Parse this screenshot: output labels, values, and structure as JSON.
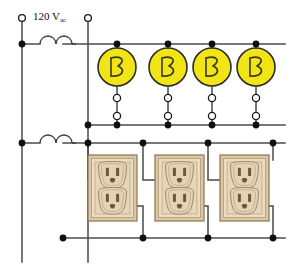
{
  "diagram": {
    "type": "schematic",
    "canvas": {
      "width": 297,
      "height": 272
    },
    "colors": {
      "wire": "#4a4a4a",
      "node": "#101010",
      "lamp_fill": "#f2e515",
      "lamp_stroke": "#2b2b2b",
      "filament": "#3a3a20",
      "outlet_plate": "#e8d9bf",
      "outlet_plate_edge": "#b29a74",
      "outlet_face": "#e0cfb2",
      "outlet_slot": "#6b5639",
      "terminal_open_stroke": "#1a1a1a",
      "terminal_open_fill": "#ffffff",
      "background": "#ffffff"
    },
    "source": {
      "label_voltage": "120 V",
      "label_subscript": "ac",
      "label_full": "120 Vac",
      "terminal_left_x": 22,
      "terminal_right_x": 88,
      "terminal_y": 18
    },
    "buses": [
      {
        "name": "upper-hot-bus",
        "y": 44,
        "x1": 22,
        "x2": 285
      },
      {
        "name": "upper-neutral-bus",
        "y": 125,
        "x1": 22,
        "x2": 285
      },
      {
        "name": "lower-hot-bus",
        "y": 143,
        "x1": 22,
        "x2": 285
      },
      {
        "name": "lower-neutral-bus",
        "y": 238,
        "x1": 22,
        "x2": 285
      }
    ],
    "rails": [
      {
        "name": "left-rail",
        "x": 22,
        "y1": 18,
        "y2": 262
      },
      {
        "name": "second-rail",
        "x": 88,
        "y1": 18,
        "y2": 262
      }
    ],
    "coils": [
      {
        "name": "upper-transformer-coil",
        "cx": 55,
        "cy": 44,
        "arcs": 2
      },
      {
        "name": "lower-transformer-coil",
        "cx": 55,
        "cy": 143,
        "arcs": 2
      }
    ],
    "lamps": [
      {
        "id": "lamp-1",
        "cx": 117,
        "cy": 67,
        "r": 19,
        "glyph": "filament"
      },
      {
        "id": "lamp-2",
        "cx": 168,
        "cy": 67,
        "r": 19,
        "glyph": "filament"
      },
      {
        "id": "lamp-3",
        "cx": 212,
        "cy": 67,
        "r": 19,
        "glyph": "filament"
      },
      {
        "id": "lamp-4",
        "cx": 256,
        "cy": 67,
        "r": 19,
        "glyph": "filament"
      }
    ],
    "lamp_terminals": [
      {
        "cx": 117,
        "cy": 98
      },
      {
        "cx": 117,
        "cy": 116
      },
      {
        "cx": 168,
        "cy": 98
      },
      {
        "cx": 168,
        "cy": 116
      },
      {
        "cx": 212,
        "cy": 98
      },
      {
        "cx": 212,
        "cy": 116
      },
      {
        "cx": 256,
        "cy": 98
      },
      {
        "cx": 256,
        "cy": 116
      }
    ],
    "receptacles": [
      {
        "id": "receptacle-1",
        "x": 88,
        "y": 155,
        "w": 49,
        "h": 66,
        "outlets": 2
      },
      {
        "id": "receptacle-2",
        "x": 155,
        "y": 155,
        "w": 49,
        "h": 66,
        "outlets": 2
      },
      {
        "id": "receptacle-3",
        "x": 220,
        "y": 155,
        "w": 49,
        "h": 66,
        "outlets": 2
      }
    ],
    "junction_nodes": [
      {
        "x": 22,
        "y": 44
      },
      {
        "x": 22,
        "y": 143
      },
      {
        "x": 117,
        "y": 44
      },
      {
        "x": 168,
        "y": 44
      },
      {
        "x": 212,
        "y": 44
      },
      {
        "x": 256,
        "y": 44
      },
      {
        "x": 88,
        "y": 125
      },
      {
        "x": 117,
        "y": 125
      },
      {
        "x": 168,
        "y": 125
      },
      {
        "x": 212,
        "y": 125
      },
      {
        "x": 256,
        "y": 125
      },
      {
        "x": 88,
        "y": 143
      },
      {
        "x": 143,
        "y": 143
      },
      {
        "x": 208,
        "y": 143
      },
      {
        "x": 273,
        "y": 143
      },
      {
        "x": 63,
        "y": 238
      },
      {
        "x": 143,
        "y": 238
      },
      {
        "x": 208,
        "y": 238
      },
      {
        "x": 273,
        "y": 238
      }
    ],
    "open_terminals": [
      {
        "name": "source-terminal-left",
        "cx": 22,
        "cy": 18
      },
      {
        "name": "source-terminal-right",
        "cx": 88,
        "cy": 18
      }
    ]
  }
}
